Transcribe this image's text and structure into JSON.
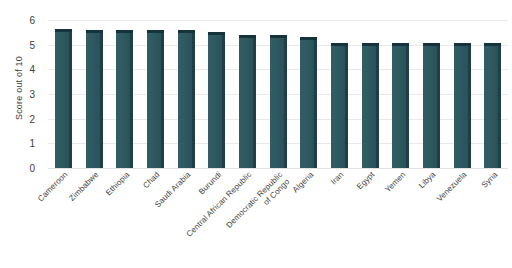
{
  "chart_data": {
    "type": "bar",
    "title": "",
    "subtitle": "",
    "xlabel": "",
    "ylabel": "Score out of 10",
    "ylim": [
      0,
      6
    ],
    "ytick_labels": [
      "6",
      "5",
      "4",
      "3",
      "2",
      "1",
      "0"
    ],
    "ytick_values": [
      6,
      5,
      4,
      3,
      2,
      1,
      0
    ],
    "grid": true,
    "legend": false,
    "legend_position": "none",
    "orientation": "vertical",
    "bar_color": "#2f5a61",
    "bar_cap_color": "#14333b",
    "bar_side_color": "#1e3f47",
    "background_color": "#ffffff",
    "gridline_color": "#e9e9e9",
    "categories": [
      "Cameroon",
      "Zimbabwe",
      "Ethiopia",
      "Chad",
      "Saudi Arabia",
      "Burundi",
      "Central African Republic",
      "Democratic Republic\nof Congo",
      "Algeria",
      "Iran",
      "Egypt",
      "Yemen",
      "Libya",
      "Venezuela",
      "Syria"
    ],
    "values": [
      5.65,
      5.6,
      5.6,
      5.6,
      5.6,
      5.5,
      5.4,
      5.4,
      5.3,
      5.05,
      5.05,
      5.05,
      5.05,
      5.05,
      5.05
    ]
  }
}
